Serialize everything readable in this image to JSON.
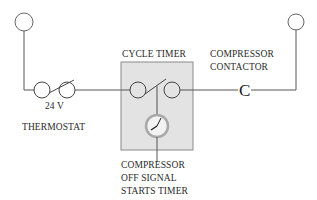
{
  "labels": {
    "cycle_timer": "CYCLE TIMER",
    "compressor_contactor_line1": "COMPRESSOR",
    "compressor_contactor_line2": "CONTACTOR",
    "voltage": "24 V",
    "thermostat": "THERMOSTAT",
    "signal_line1": "COMPRESSOR",
    "signal_line2": "OFF SIGNAL",
    "signal_line3": "STARTS TIMER",
    "contactor_symbol": "C"
  },
  "colors": {
    "wire": "#555555",
    "timer_box_fill": "#e3e3e3",
    "timer_box_stroke": "#8a8a8a",
    "clock_ring": "#a8a8a8"
  }
}
